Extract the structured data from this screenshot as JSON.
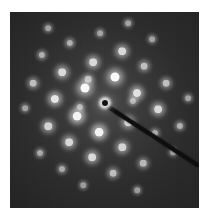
{
  "image": {
    "description": "Selected-area electron diffraction pattern with hexagonal spot array and beam stop",
    "panel": {
      "left": 10,
      "top": 12,
      "width": 189,
      "height": 196
    },
    "background_color": "#2b2b2b",
    "center_beam": {
      "x": 105,
      "y": 103
    },
    "beam_stop": {
      "x1": 107,
      "y1": 106,
      "x2": 199,
      "y2": 166,
      "color": "#0c0c0c"
    },
    "spots": [
      {
        "x": 115,
        "y": 77,
        "i": 1.0
      },
      {
        "x": 85,
        "y": 88,
        "i": 1.0
      },
      {
        "x": 77,
        "y": 116,
        "i": 0.95
      },
      {
        "x": 99,
        "y": 132,
        "i": 0.95
      },
      {
        "x": 55,
        "y": 99,
        "i": 0.85
      },
      {
        "x": 137,
        "y": 93,
        "i": 0.8
      },
      {
        "x": 158,
        "y": 109,
        "i": 0.75
      },
      {
        "x": 128,
        "y": 122,
        "i": 0.7
      },
      {
        "x": 122,
        "y": 51,
        "i": 0.75
      },
      {
        "x": 93,
        "y": 62,
        "i": 0.75
      },
      {
        "x": 62,
        "y": 72,
        "i": 0.75
      },
      {
        "x": 33,
        "y": 83,
        "i": 0.55
      },
      {
        "x": 48,
        "y": 126,
        "i": 0.7
      },
      {
        "x": 69,
        "y": 142,
        "i": 0.75
      },
      {
        "x": 92,
        "y": 157,
        "i": 0.75
      },
      {
        "x": 122,
        "y": 147,
        "i": 0.7
      },
      {
        "x": 143,
        "y": 163,
        "i": 0.5
      },
      {
        "x": 113,
        "y": 173,
        "i": 0.55
      },
      {
        "x": 166,
        "y": 83,
        "i": 0.55
      },
      {
        "x": 144,
        "y": 66,
        "i": 0.55
      },
      {
        "x": 180,
        "y": 126,
        "i": 0.45
      },
      {
        "x": 88,
        "y": 79,
        "i": 0.5
      },
      {
        "x": 80,
        "y": 107,
        "i": 0.45
      },
      {
        "x": 40,
        "y": 153,
        "i": 0.4
      },
      {
        "x": 62,
        "y": 169,
        "i": 0.4
      },
      {
        "x": 70,
        "y": 43,
        "i": 0.45
      },
      {
        "x": 42,
        "y": 55,
        "i": 0.45
      },
      {
        "x": 48,
        "y": 28,
        "i": 0.35
      },
      {
        "x": 100,
        "y": 33,
        "i": 0.35
      },
      {
        "x": 128,
        "y": 23,
        "i": 0.35
      },
      {
        "x": 152,
        "y": 39,
        "i": 0.35
      },
      {
        "x": 188,
        "y": 98,
        "i": 0.35
      },
      {
        "x": 25,
        "y": 108,
        "i": 0.35
      },
      {
        "x": 173,
        "y": 152,
        "i": 0.35
      },
      {
        "x": 83,
        "y": 185,
        "i": 0.3
      },
      {
        "x": 137,
        "y": 190,
        "i": 0.3
      },
      {
        "x": 133,
        "y": 101,
        "i": 0.45
      },
      {
        "x": 155,
        "y": 133,
        "i": 0.4
      }
    ]
  }
}
